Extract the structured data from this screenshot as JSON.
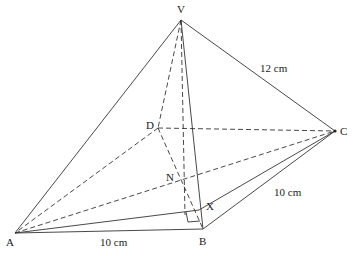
{
  "points": {
    "V": {
      "label": "V",
      "x": 181,
      "y": 20
    },
    "A": {
      "label": "A",
      "x": 15,
      "y": 233
    },
    "B": {
      "label": "B",
      "x": 203,
      "y": 229
    },
    "C": {
      "label": "C",
      "x": 335,
      "y": 131
    },
    "D": {
      "label": "D",
      "x": 158,
      "y": 128
    },
    "N": {
      "label": "N",
      "x": 181,
      "y": 178
    },
    "X": {
      "label": "X",
      "x": 199,
      "y": 210
    }
  },
  "measures": {
    "vc": "12 cm",
    "ab": "10 cm",
    "bc": "10 cm"
  },
  "colors": {
    "line": "#333333"
  }
}
